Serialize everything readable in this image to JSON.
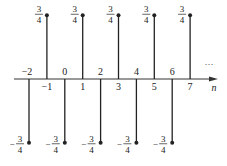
{
  "chart_data": {
    "type": "stem",
    "title": "",
    "xlabel": "n",
    "ylabel": "",
    "x": [
      -2,
      -1,
      0,
      1,
      2,
      3,
      4,
      5,
      6,
      7
    ],
    "values": [
      -0.75,
      0.75,
      -0.75,
      0.75,
      -0.75,
      0.75,
      -0.75,
      0.75,
      -0.75,
      0.75
    ],
    "value_labels": [
      "-3/4",
      "3/4",
      "-3/4",
      "3/4",
      "-3/4",
      "3/4",
      "-3/4",
      "3/4",
      "-3/4",
      "3/4"
    ],
    "x_tick_labels": [
      "-2",
      "-1",
      "0",
      "1",
      "2",
      "3",
      "4",
      "5",
      "6",
      "7"
    ],
    "continuation": "...",
    "grid": false,
    "legend": null
  },
  "labels": {
    "axis_n": "n",
    "ellipsis": "···",
    "pos_num": "3",
    "pos_den": "4",
    "neg_sign": "−"
  },
  "colors": {
    "stem": "#222222",
    "axis": "#333333"
  }
}
